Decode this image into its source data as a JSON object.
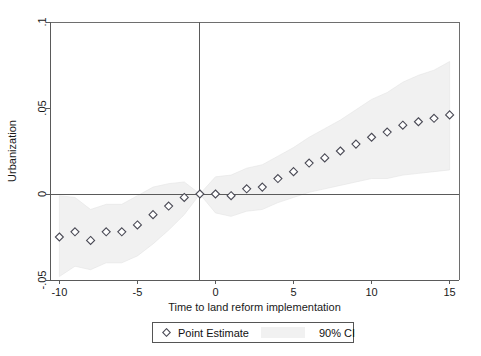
{
  "chart_data": {
    "type": "scatter",
    "title": "",
    "xlabel": "Time to land reform implementation",
    "ylabel": "Urbanization",
    "xlim": [
      -10.6,
      15.6
    ],
    "ylim": [
      -0.05,
      0.1
    ],
    "xticks": [
      -10,
      -5,
      0,
      5,
      10,
      15
    ],
    "xticklabels": [
      "-10",
      "-5",
      "0",
      "5",
      "10",
      "15"
    ],
    "yticks": [
      -0.05,
      0,
      0.05,
      0.1
    ],
    "yticklabels": [
      "-.05",
      "0",
      ".05",
      ".1"
    ],
    "grid": false,
    "zero_hline": 0,
    "reference_vline": -1,
    "legend_position": "below-axes",
    "legend": [
      {
        "label": "Point Estimate",
        "marker": "open-diamond",
        "color": "#4a4a55"
      },
      {
        "label": "90% CI",
        "marker": "band",
        "color": "#f1f1f1"
      }
    ],
    "x": [
      -10,
      -9,
      -8,
      -7,
      -6,
      -5,
      -4,
      -3,
      -2,
      -1,
      0,
      1,
      2,
      3,
      4,
      5,
      6,
      7,
      8,
      9,
      10,
      11,
      12,
      13,
      14,
      15
    ],
    "series": [
      {
        "name": "Point Estimate",
        "values": [
          -0.025,
          -0.022,
          -0.027,
          -0.022,
          -0.022,
          -0.018,
          -0.012,
          -0.007,
          -0.002,
          0.0,
          0.0,
          -0.001,
          0.003,
          0.004,
          0.009,
          0.013,
          0.018,
          0.021,
          0.025,
          0.029,
          0.033,
          0.036,
          0.04,
          0.042,
          0.044,
          0.046
        ]
      },
      {
        "name": "90% CI lower",
        "values": [
          -0.048,
          -0.042,
          -0.044,
          -0.04,
          -0.04,
          -0.036,
          -0.029,
          -0.021,
          -0.012,
          0.0,
          -0.011,
          -0.013,
          -0.01,
          -0.009,
          -0.005,
          -0.002,
          0.001,
          0.003,
          0.005,
          0.007,
          0.009,
          0.009,
          0.011,
          0.012,
          0.013,
          0.014
        ]
      },
      {
        "name": "90% CI upper",
        "values": [
          -0.001,
          -0.002,
          -0.009,
          -0.006,
          -0.006,
          -0.001,
          0.004,
          0.006,
          0.007,
          0.0,
          0.01,
          0.011,
          0.015,
          0.017,
          0.022,
          0.027,
          0.033,
          0.038,
          0.043,
          0.049,
          0.055,
          0.059,
          0.065,
          0.069,
          0.072,
          0.077
        ]
      }
    ]
  }
}
